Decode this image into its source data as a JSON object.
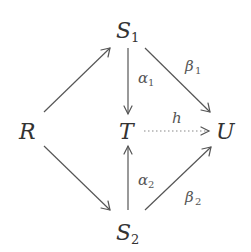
{
  "diagram": {
    "type": "commutative-diagram",
    "nodes": {
      "R": {
        "base": "R",
        "sub": ""
      },
      "S1": {
        "base": "S",
        "sub": "1"
      },
      "S2": {
        "base": "S",
        "sub": "2"
      },
      "T": {
        "base": "T",
        "sub": ""
      },
      "U": {
        "base": "U",
        "sub": ""
      }
    },
    "edges": {
      "R_S1": {
        "from": "R",
        "to": "S1",
        "label": "",
        "style": "solid"
      },
      "R_S2": {
        "from": "R",
        "to": "S2",
        "label": "",
        "style": "solid"
      },
      "S1_T": {
        "from": "S1",
        "to": "T",
        "label_base": "α",
        "label_sub": "1",
        "style": "solid"
      },
      "S2_T": {
        "from": "S2",
        "to": "T",
        "label_base": "α",
        "label_sub": "2",
        "style": "solid"
      },
      "S1_U": {
        "from": "S1",
        "to": "U",
        "label_base": "β",
        "label_sub": "1",
        "style": "solid"
      },
      "S2_U": {
        "from": "S2",
        "to": "U",
        "label_base": "β",
        "label_sub": "2",
        "style": "solid"
      },
      "T_U": {
        "from": "T",
        "to": "U",
        "label_base": "h",
        "label_sub": "",
        "style": "dotted"
      }
    }
  }
}
